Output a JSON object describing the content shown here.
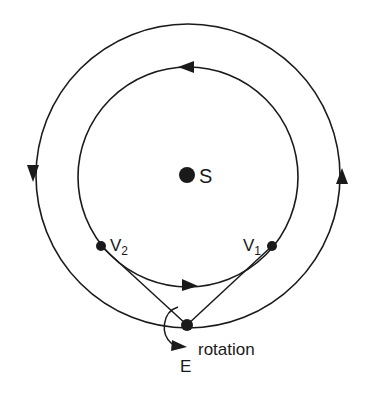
{
  "diagram": {
    "type": "orbital-diagram",
    "colors": {
      "ink": "#1a1a1a",
      "background": "#ffffff"
    },
    "sun": {
      "label": "S",
      "cx": 187,
      "cy": 175,
      "r": 8
    },
    "outer_orbit": {
      "cx": 188,
      "cy": 176,
      "r": 152,
      "direction": "counterclockwise-arrows-left-down-right-up"
    },
    "inner_orbit": {
      "cx": 188,
      "cy": 177,
      "r": 110,
      "direction": "arrows-top-left-bottom-right"
    },
    "points": [
      {
        "id": "V2",
        "label": "V",
        "subscript": "2",
        "cx": 101,
        "cy": 246
      },
      {
        "id": "V1",
        "label": "V",
        "subscript": "1",
        "cx": 272,
        "cy": 246
      },
      {
        "id": "E",
        "label": "E",
        "cx": 187,
        "cy": 325
      }
    ],
    "sight_lines": [
      {
        "from": "E",
        "to": "V2"
      },
      {
        "from": "E",
        "to": "V1"
      }
    ],
    "rotation_label": "rotation"
  }
}
